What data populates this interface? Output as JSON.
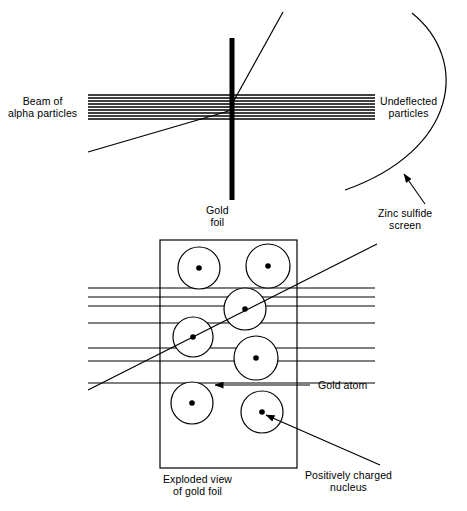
{
  "figure": {
    "width": 467,
    "height": 511,
    "background_color": "#ffffff",
    "stroke_color": "#000000"
  },
  "labels": {
    "beam": "Beam of\nalpha particles",
    "undeflected": "Undeflected\nparticles",
    "gold_foil": "Gold\nfoil",
    "zinc_sulfide": "Zinc sulfide\nscreen",
    "gold_atom": "Gold atom",
    "positively_charged_nucleus": "Positively charged\nnucleus",
    "exploded_view": "Exploded view\nof gold foil"
  },
  "top_panel": {
    "beam": {
      "description": "Parallel alpha particle beam",
      "x_start": 88,
      "x_end": 375,
      "line_ys": [
        95,
        98,
        101,
        104,
        107,
        110,
        113,
        116,
        119
      ],
      "stroke_width": 1.5
    },
    "gold_foil_bar": {
      "x": 232,
      "y_top": 38,
      "y_bottom": 200,
      "thickness": 5
    },
    "deflected_rays": [
      {
        "name": "upward-deflected-ray",
        "x1": 232,
        "y1": 104,
        "x2": 283,
        "y2": 12
      },
      {
        "name": "downward-deflected-ray",
        "x1": 232,
        "y1": 110,
        "x2": 88,
        "y2": 152
      }
    ],
    "zinc_sulfide_arc": {
      "start_x": 412,
      "start_y": 13,
      "ctrl1_x": 470,
      "ctrl1_y": 60,
      "ctrl2_x": 458,
      "ctrl2_y": 150,
      "end_x": 345,
      "end_y": 190
    },
    "zinc_sulfide_arrow": {
      "x1": 425,
      "y1": 204,
      "x2": 404,
      "y2": 174
    }
  },
  "bottom_panel": {
    "foil_rect": {
      "x": 160,
      "y": 240,
      "width": 137,
      "height": 228
    },
    "atoms": [
      {
        "cx": 199,
        "cy": 268,
        "r": 21,
        "nucleus_r": 2.8
      },
      {
        "cx": 268,
        "cy": 266,
        "r": 22,
        "nucleus_r": 2.8
      },
      {
        "cx": 245,
        "cy": 309,
        "r": 21,
        "nucleus_r": 2.8
      },
      {
        "cx": 193,
        "cy": 337,
        "r": 20,
        "nucleus_r": 2.8
      },
      {
        "cx": 256,
        "cy": 358,
        "r": 22,
        "nucleus_r": 2.8
      },
      {
        "cx": 192,
        "cy": 403,
        "r": 21,
        "nucleus_r": 2.8
      },
      {
        "cx": 262,
        "cy": 412,
        "r": 21,
        "nucleus_r": 2.8
      }
    ],
    "beam_lines": [
      {
        "x1": 88,
        "y1": 288,
        "x2": 375,
        "y2": 288
      },
      {
        "x1": 88,
        "y1": 297,
        "x2": 375,
        "y2": 297
      },
      {
        "x1": 88,
        "y1": 306,
        "x2": 375,
        "y2": 306
      },
      {
        "x1": 88,
        "y1": 323,
        "x2": 375,
        "y2": 323
      },
      {
        "x1": 88,
        "y1": 348,
        "x2": 375,
        "y2": 348
      },
      {
        "x1": 88,
        "y1": 361,
        "x2": 375,
        "y2": 361
      },
      {
        "x1": 88,
        "y1": 383,
        "x2": 375,
        "y2": 383
      }
    ],
    "scatter_line": {
      "x1": 88,
      "y1": 390,
      "x2": 377,
      "y2": 244
    },
    "gold_atom_arrow": {
      "x1": 310,
      "y1": 385,
      "x2": 215,
      "y2": 385
    },
    "nucleus_arrow": {
      "x1": 380,
      "y1": 465,
      "x2": 266,
      "y2": 415
    }
  },
  "label_positions": {
    "beam": {
      "left": 8,
      "top": 96
    },
    "undeflected": {
      "left": 380,
      "top": 96
    },
    "gold_foil": {
      "left": 206,
      "top": 205
    },
    "zinc_sulfide": {
      "left": 378,
      "top": 208
    },
    "gold_atom": {
      "left": 318,
      "top": 380
    },
    "nucleus": {
      "left": 305,
      "top": 470
    },
    "exploded": {
      "left": 163,
      "top": 474
    }
  }
}
